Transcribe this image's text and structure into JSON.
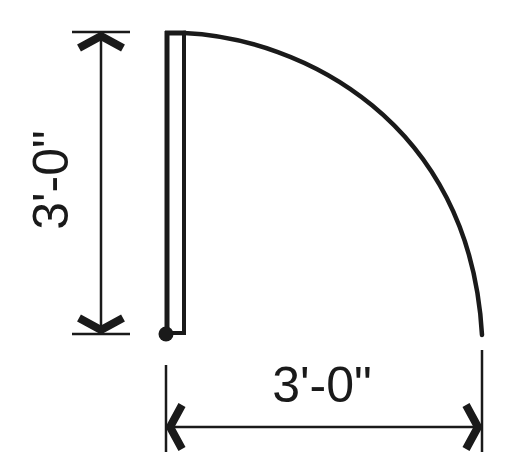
{
  "diagram": {
    "type": "door-swing-clearance",
    "colors": {
      "stroke": "#1a1a1a",
      "background": "#ffffff"
    },
    "dimensions": {
      "vertical": {
        "label": "3'-0\""
      },
      "horizontal": {
        "label": "3'-0\""
      }
    },
    "elements": [
      "door-panel",
      "hinge-pivot",
      "swing-arc",
      "vertical-dimension-line",
      "horizontal-dimension-line"
    ]
  }
}
